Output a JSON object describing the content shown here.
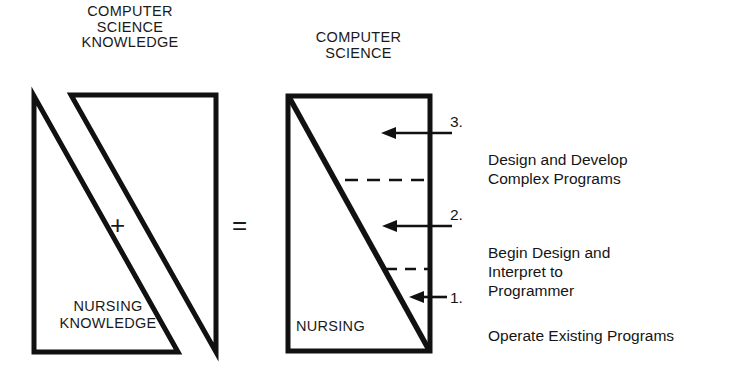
{
  "diagram": {
    "left": {
      "header": "COMPUTER\nSCIENCE\nKNOWLEDGE",
      "bottom_label": "NURSING\nKNOWLEDGE",
      "operator_plus": "+",
      "operator_equals": "="
    },
    "right": {
      "header": "COMPUTER\nSCIENCE",
      "bottom_label": "NURSING"
    },
    "legend": [
      {
        "number": "3.",
        "text": "Design and Develop\nComplex Programs"
      },
      {
        "number": "2.",
        "text": "Begin Design and\nInterpret to\nProgrammer"
      },
      {
        "number": "1.",
        "text": "Operate Existing Programs"
      }
    ],
    "colors": {
      "ink": "#111111",
      "background": "#ffffff"
    }
  }
}
